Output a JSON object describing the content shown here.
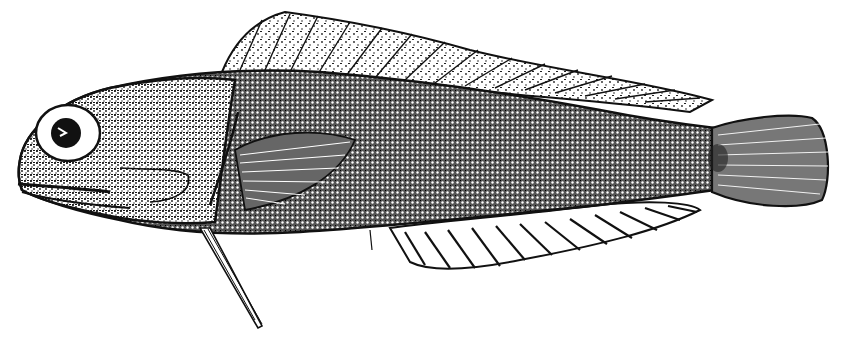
{
  "image": {
    "subject": "fish illustration",
    "style": "black and white stippled scientific line drawing",
    "background": "#ffffff",
    "ink": "#111111",
    "parts": [
      "head",
      "eye",
      "mouth",
      "gill-cover",
      "body",
      "dorsal-fin",
      "pectoral-fin",
      "pelvic-fin",
      "anal-fin",
      "caudal-fin"
    ]
  }
}
